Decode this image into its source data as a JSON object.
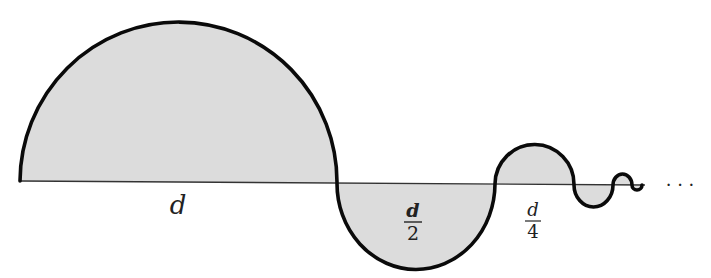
{
  "diagram": {
    "type": "alternating-semicircles",
    "colors": {
      "fill": "#dcdcdc",
      "stroke": "#0a0a0a",
      "baseline": "#333333",
      "text": "#222222"
    },
    "baseline": {
      "x1": 20,
      "y1": 181,
      "x2": 645,
      "y2": 185
    },
    "semicircles": [
      {
        "index": 1,
        "diameter_label": "d",
        "side": "above",
        "x_start": 20,
        "x_end": 337
      },
      {
        "index": 2,
        "diameter_label": "d/2",
        "side": "below",
        "x_start": 337,
        "x_end": 495
      },
      {
        "index": 3,
        "diameter_label": "d/4",
        "side": "above",
        "x_start": 495,
        "x_end": 574
      },
      {
        "index": 4,
        "diameter_label": "",
        "side": "below",
        "x_start": 574,
        "x_end": 613
      },
      {
        "index": 5,
        "diameter_label": "",
        "side": "above",
        "x_start": 613,
        "x_end": 632
      },
      {
        "index": 6,
        "diameter_label": "",
        "side": "below",
        "x_start": 632,
        "x_end": 642
      }
    ],
    "labels": {
      "first": {
        "text": "d"
      },
      "second": {
        "numerator": "d",
        "denominator": "2"
      },
      "third": {
        "numerator": "d",
        "denominator": "4"
      }
    },
    "continuation": "· · ·"
  }
}
